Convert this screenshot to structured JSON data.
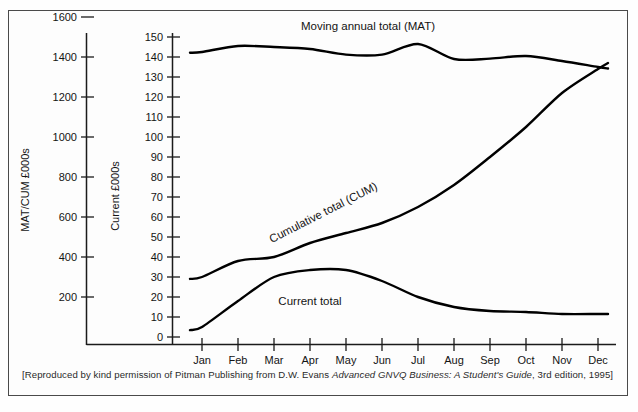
{
  "figure": {
    "caption_prefix": "[Reproduced by kind permission of Pitman Publishing from D.W. Evans ",
    "caption_italic": "Advanced GNVQ Business: A Student's Guide",
    "caption_suffix": ", 3rd edition, 1995]",
    "line_color": "#000000",
    "axis_color": "#1b1b1b",
    "border_color": "#4a4a4a"
  },
  "chart_data": {
    "type": "line",
    "title": "Moving annual total (MAT)",
    "xlabel": "",
    "ylabel": "Current £000s",
    "secondary_ylabel": "MAT/CUM £000s",
    "grid": false,
    "legend_position": "inline-labels",
    "categories": [
      "Jan",
      "Feb",
      "Mar",
      "Apr",
      "May",
      "Jun",
      "Jul",
      "Aug",
      "Sep",
      "Oct",
      "Nov",
      "Dec"
    ],
    "x": [
      "Jan",
      "Feb",
      "Mar",
      "Apr",
      "May",
      "Jun",
      "Jul",
      "Aug",
      "Sep",
      "Oct",
      "Nov",
      "Dec"
    ],
    "ylim": [
      0,
      150
    ],
    "yticks": [
      0,
      10,
      20,
      30,
      40,
      50,
      60,
      70,
      80,
      90,
      100,
      110,
      120,
      130,
      140,
      150
    ],
    "secondary_ylim": [
      0,
      1700
    ],
    "secondary_yticks": [
      200,
      400,
      600,
      800,
      1000,
      1200,
      1400,
      1600
    ],
    "series": [
      {
        "name": "Moving annual total (MAT)",
        "axis": "secondary",
        "label": "Moving annual total (MAT)",
        "units_note": "plotted on MAT/CUM £000s scale (×10)",
        "values": [
          1425,
          1455,
          1450,
          1440,
          1412,
          1412,
          1465,
          1390,
          1392,
          1405,
          1380,
          1350
        ]
      },
      {
        "name": "Cumulative total (CUM)",
        "axis": "secondary",
        "label": "Cumulative total (CUM)",
        "units_note": "plotted on MAT/CUM £000s scale (×10)",
        "values": [
          300,
          380,
          400,
          470,
          520,
          570,
          650,
          760,
          900,
          1050,
          1220,
          1340
        ]
      },
      {
        "name": "Current total",
        "axis": "primary",
        "label": "Current total",
        "values": [
          5,
          18,
          30,
          33.5,
          33.5,
          28,
          20,
          15,
          13,
          12.5,
          11.5,
          11.5
        ]
      }
    ],
    "annotations": [
      {
        "text": "Moving annual total (MAT)",
        "x": 368,
        "y": 30
      },
      {
        "text": "Cumulative total (CUM)",
        "x": 325,
        "y": 216,
        "rotation": -27
      },
      {
        "text": "Current total",
        "x": 310,
        "y": 305
      }
    ]
  }
}
